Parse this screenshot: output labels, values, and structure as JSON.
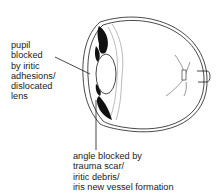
{
  "diagram": {
    "labels": {
      "pupil": {
        "lines": [
          "pupil",
          "blocked",
          "by iritic",
          "adhesions/",
          "dislocated",
          "lens"
        ]
      },
      "angle": {
        "lines": [
          "angle blocked by",
          "trauma scar/",
          "iritic debris/",
          "iris new vessel formation"
        ]
      }
    },
    "colors": {
      "ink": "#1a1a1a",
      "background": "#ffffff"
    }
  }
}
